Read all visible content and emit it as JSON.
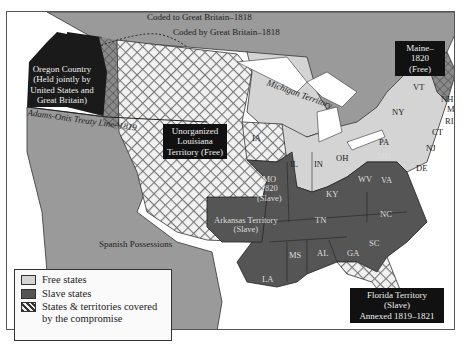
{
  "colors": {
    "free": "#d4d4d4",
    "slave": "#555555",
    "foreign": "#9a9a9a",
    "oregon": "#1a1a1a",
    "water": "#ffffff",
    "label_box": "#111111"
  },
  "annotations": {
    "ceded_to": "Coded to Great Britain–1818",
    "ceded_by": "Coded by Great Britain–1818",
    "treaty_line": "Adams-Onis Treaty Line–1819",
    "michigan": "Michigan Territory",
    "spanish": "Spanish Possessions"
  },
  "boxes": {
    "oregon": [
      "Oregon Country",
      "(Held jointly by",
      "United States and",
      "Great Britain)"
    ],
    "louisiana": [
      "Unorganized",
      "Louisiana",
      "Territory (Free)"
    ],
    "maine": [
      "Maine–1820",
      "(Free)"
    ],
    "florida": [
      "Florida Territory (Slave)",
      "Annexed 1819–1821"
    ]
  },
  "states": {
    "free": [
      "IA",
      "IL",
      "IN",
      "OH",
      "PA",
      "NY",
      "VT",
      "NH",
      "MA",
      "RI",
      "CT",
      "NJ"
    ],
    "slave": [
      "MO",
      "KY",
      "WV",
      "VA",
      "MD",
      "DE",
      "TN",
      "NC",
      "SC",
      "GA",
      "AL",
      "MS",
      "LA"
    ],
    "mo_lines": [
      "MO",
      "1820",
      "(Slave)"
    ],
    "arkansas_lines": [
      "Arkansas Territory",
      "(Slave)"
    ]
  },
  "legend": {
    "items": [
      {
        "label": "Free states",
        "type": "free"
      },
      {
        "label": "Slave states",
        "type": "slave"
      },
      {
        "label": "States & territories covered by the compromise",
        "type": "hatched"
      }
    ]
  }
}
